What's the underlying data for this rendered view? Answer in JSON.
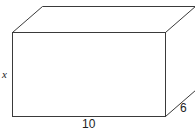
{
  "diagram": {
    "type": "rectangular-box",
    "labels": {
      "height": "x",
      "length": "10",
      "depth": "6"
    },
    "colors": {
      "stroke": "#3a3a3a",
      "background": "#ffffff"
    }
  }
}
